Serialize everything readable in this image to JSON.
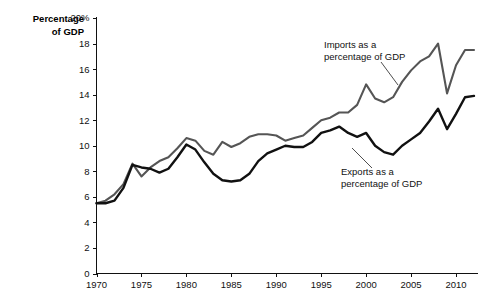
{
  "chart_data": {
    "type": "line",
    "title": "",
    "xlabel": "",
    "ylabel": "Percentage of GDP",
    "ylabel_line1": "Percentage",
    "ylabel_line2": "of GDP",
    "xlim": [
      1970,
      2012
    ],
    "ylim": [
      0,
      20
    ],
    "grid": false,
    "legend_position": "inline-annotation",
    "y_ticks": [
      0,
      2,
      4,
      6,
      8,
      10,
      12,
      14,
      16,
      18,
      20
    ],
    "y_tick_labels": [
      "0",
      "2",
      "4",
      "6",
      "8",
      "10",
      "12",
      "14",
      "16",
      "18",
      "20%"
    ],
    "x_ticks": [
      1970,
      1975,
      1980,
      1985,
      1990,
      1995,
      2000,
      2005,
      2010
    ],
    "x_tick_labels": [
      "1970",
      "1975",
      "1980",
      "1985",
      "1990",
      "1995",
      "2000",
      "2005",
      "2010"
    ],
    "x": [
      1970,
      1971,
      1972,
      1973,
      1974,
      1975,
      1976,
      1977,
      1978,
      1979,
      1980,
      1981,
      1982,
      1983,
      1984,
      1985,
      1986,
      1987,
      1988,
      1989,
      1990,
      1991,
      1992,
      1993,
      1994,
      1995,
      1996,
      1997,
      1998,
      1999,
      2000,
      2001,
      2002,
      2003,
      2004,
      2005,
      2006,
      2007,
      2008,
      2009,
      2010,
      2011,
      2012
    ],
    "series": [
      {
        "name": "Imports as a percentage of GDP",
        "color": "#555555",
        "values": [
          5.5,
          5.7,
          6.2,
          7.0,
          8.6,
          7.6,
          8.3,
          8.8,
          9.1,
          9.8,
          10.6,
          10.4,
          9.6,
          9.3,
          10.3,
          9.9,
          10.2,
          10.7,
          10.9,
          10.9,
          10.8,
          10.4,
          10.6,
          10.8,
          11.4,
          12.0,
          12.2,
          12.6,
          12.6,
          13.2,
          14.8,
          13.7,
          13.4,
          13.8,
          15.0,
          15.9,
          16.6,
          17.0,
          18.0,
          14.1,
          16.3,
          17.5,
          17.5
        ]
      },
      {
        "name": "Exports as a percentage of GDP",
        "color": "#111111",
        "values": [
          5.5,
          5.5,
          5.7,
          6.7,
          8.5,
          8.3,
          8.2,
          7.9,
          8.2,
          9.1,
          10.1,
          9.7,
          8.7,
          7.8,
          7.3,
          7.2,
          7.3,
          7.8,
          8.8,
          9.4,
          9.7,
          10.0,
          9.9,
          9.9,
          10.3,
          11.0,
          11.2,
          11.5,
          11.0,
          10.7,
          11.0,
          10.0,
          9.5,
          9.3,
          10.0,
          10.5,
          11.0,
          11.9,
          12.9,
          11.3,
          12.5,
          13.8,
          13.9
        ]
      }
    ],
    "annotations": [
      {
        "id": "imports-annotation",
        "line1": "Imports as a",
        "line2": "percentage of GDP",
        "text_x": 324,
        "text_y": 48,
        "leader": [
          [
            381,
            62
          ],
          [
            398,
            85
          ]
        ]
      },
      {
        "id": "exports-annotation",
        "line1": "Exports as a",
        "line2": "a percentage of GDP",
        "line2_display": "percentage of GDP",
        "text_x": 341,
        "text_y": 175,
        "leader": [
          [
            372,
            168
          ],
          [
            352,
            148
          ]
        ]
      }
    ]
  },
  "colors": {
    "background": "#ffffff",
    "axis": "#111111",
    "imports_line": "#555555",
    "exports_line": "#111111"
  }
}
